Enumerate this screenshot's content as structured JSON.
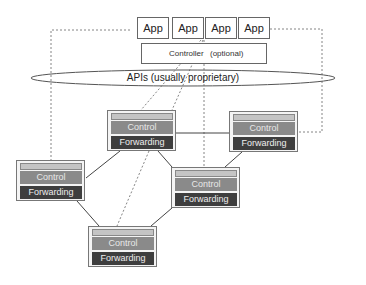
{
  "apps": [
    {
      "label": "App"
    },
    {
      "label": "App"
    },
    {
      "label": "App"
    },
    {
      "label": "App"
    }
  ],
  "controller": {
    "label": "Controller",
    "note": "(optional)"
  },
  "api": {
    "label": "APIs (usually proprietary)"
  },
  "switches": [
    {
      "id": "s1",
      "control": "Control",
      "forwarding": "Forwarding"
    },
    {
      "id": "s2",
      "control": "Control",
      "forwarding": "Forwarding"
    },
    {
      "id": "s3",
      "control": "Control",
      "forwarding": "Forwarding"
    },
    {
      "id": "s4",
      "control": "Control",
      "forwarding": "Forwarding"
    },
    {
      "id": "s5",
      "control": "Control",
      "forwarding": "Forwarding"
    }
  ],
  "colors": {
    "control": "#8a8a8a",
    "forwarding": "#3e3e3e",
    "line": "#444444"
  }
}
